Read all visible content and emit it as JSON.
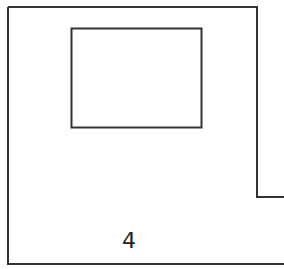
{
  "diagram": {
    "type": "floor-plan",
    "stroke_color": "#333333",
    "background": "#ffffff",
    "room": {
      "label": "4",
      "outline_points": "8,7 257,7 257,197 284,197 284,264 8,264"
    },
    "inner_rectangle": {
      "x": 71,
      "y": 28,
      "width": 130,
      "height": 99
    }
  }
}
